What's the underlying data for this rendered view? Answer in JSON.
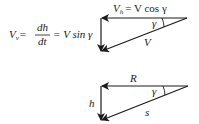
{
  "diagram": {
    "top_triangle": {
      "horizontal_label": {
        "lhs": "V",
        "sub": "h",
        "rhs": "= V cos γ"
      },
      "angle_label": "γ",
      "hypotenuse_label": "V",
      "equation": {
        "lhs": "V",
        "lhs_sub": "v",
        "eq1": "=",
        "numerator": "dh",
        "denominator": "dt",
        "eq2": "= V sin γ"
      }
    },
    "bottom_triangle": {
      "horizontal_label": "R",
      "vertical_label": "h",
      "angle_label": "γ",
      "hypotenuse_label": "s"
    },
    "colors": {
      "stroke": "#1a1a1a",
      "background": "#ffffff"
    }
  }
}
